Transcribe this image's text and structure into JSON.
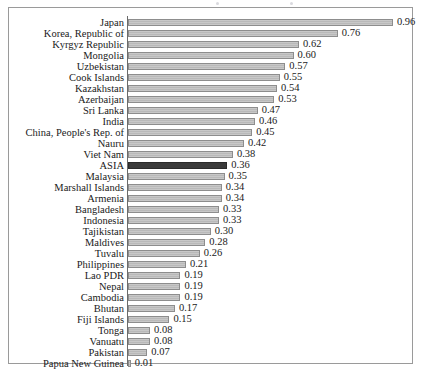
{
  "figure": {
    "frame_border_color": "#9a9a9a",
    "background": "#ffffff",
    "bar_fill": "#c3c3c3",
    "bar_border": "#8d8d8d",
    "highlight_fill": "#3a3a3a",
    "highlight_label": "ASIA"
  },
  "chart_data": {
    "type": "bar",
    "orientation": "horizontal",
    "title": "",
    "subtitle": "",
    "xlabel": "",
    "ylabel": "",
    "xlim": [
      0,
      1.0
    ],
    "grid": false,
    "legend": null,
    "value_label_format": "0.00",
    "highlight_category": "ASIA",
    "categories": [
      "Japan",
      "Korea, Republic of",
      "Kyrgyz Republic",
      "Mongolia",
      "Uzbekistan",
      "Cook Islands",
      "Kazakhstan",
      "Azerbaijan",
      "Sri Lanka",
      "India",
      "China, People's Rep. of",
      "Nauru",
      "Viet Nam",
      "ASIA",
      "Malaysia",
      "Marshall Islands",
      "Armenia",
      "Bangladesh",
      "Indonesia",
      "Tajikistan",
      "Maldives",
      "Tuvalu",
      "Philippines",
      "Lao PDR",
      "Nepal",
      "Cambodia",
      "Bhutan",
      "Fiji Islands",
      "Tonga",
      "Vanuatu",
      "Pakistan",
      "Papua New Guinea"
    ],
    "values": [
      0.96,
      0.76,
      0.62,
      0.6,
      0.57,
      0.55,
      0.54,
      0.53,
      0.47,
      0.46,
      0.45,
      0.42,
      0.38,
      0.36,
      0.35,
      0.34,
      0.34,
      0.33,
      0.33,
      0.3,
      0.28,
      0.26,
      0.21,
      0.19,
      0.19,
      0.19,
      0.17,
      0.15,
      0.08,
      0.08,
      0.07,
      0.01
    ],
    "value_labels": [
      "0.96",
      "0.76",
      "0.62",
      "0.60",
      "0.57",
      "0.55",
      "0.54",
      "0.53",
      "0.47",
      "0.46",
      "0.45",
      "0.42",
      "0.38",
      "0.36",
      "0.35",
      "0.34",
      "0.34",
      "0.33",
      "0.33",
      "0.30",
      "0.28",
      "0.26",
      "0.21",
      "0.19",
      "0.19",
      "0.19",
      "0.17",
      "0.15",
      "0.08",
      "0.08",
      "0.07",
      "0.01"
    ]
  }
}
